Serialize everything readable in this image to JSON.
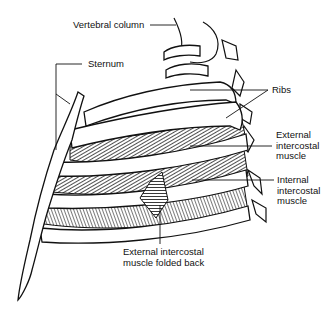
{
  "figure": {
    "type": "anatomical-diagram"
  },
  "labels": {
    "vertebral_column": "Vertebral column",
    "sternum": "Sternum",
    "ribs": "Ribs",
    "external_intercostal_line1": "External",
    "external_intercostal_line2": "intercostal",
    "external_intercostal_line3": "muscle",
    "internal_intercostal_line1": "Internal",
    "internal_intercostal_line2": "intercostal",
    "internal_intercostal_line3": "muscle",
    "folded_back_line1": "External intercostal",
    "folded_back_line2": "muscle folded back"
  },
  "colors": {
    "ink": "#111111",
    "background": "#ffffff",
    "hatch": "#333333"
  }
}
